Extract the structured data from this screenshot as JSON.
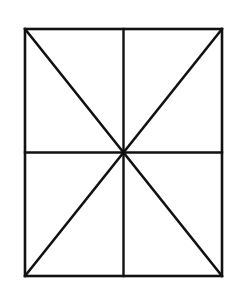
{
  "figure": {
    "background_color": "#ffffff",
    "stroke_color": "#111111",
    "canvas": {
      "width": 243,
      "height": 286
    },
    "rect": {
      "left": 25,
      "top": 29,
      "right": 222,
      "bottom": 276,
      "width": 197,
      "height": 247,
      "stroke_width": 2.6
    },
    "center": {
      "x": 123.5,
      "y": 152.5
    },
    "segments": [
      {
        "name": "vertical-midline",
        "x1": 123.5,
        "y1": 29,
        "x2": 123.5,
        "y2": 276,
        "stroke_width": 2.4
      },
      {
        "name": "horizontal-midline",
        "x1": 25,
        "y1": 152.5,
        "x2": 222,
        "y2": 152.5,
        "stroke_width": 2.4
      },
      {
        "name": "diagonal-top-left-to-center",
        "x1": 25,
        "y1": 29,
        "x2": 123.5,
        "y2": 152.5,
        "stroke_width": 2.6
      },
      {
        "name": "diagonal-top-right-to-center",
        "x1": 222,
        "y1": 29,
        "x2": 123.5,
        "y2": 152.5,
        "stroke_width": 2.6
      },
      {
        "name": "diagonal-bottom-left-to-center",
        "x1": 25,
        "y1": 276,
        "x2": 123.5,
        "y2": 152.5,
        "stroke_width": 2.6
      },
      {
        "name": "diagonal-bottom-right-to-center",
        "x1": 222,
        "y1": 276,
        "x2": 123.5,
        "y2": 152.5,
        "stroke_width": 2.6
      }
    ]
  }
}
